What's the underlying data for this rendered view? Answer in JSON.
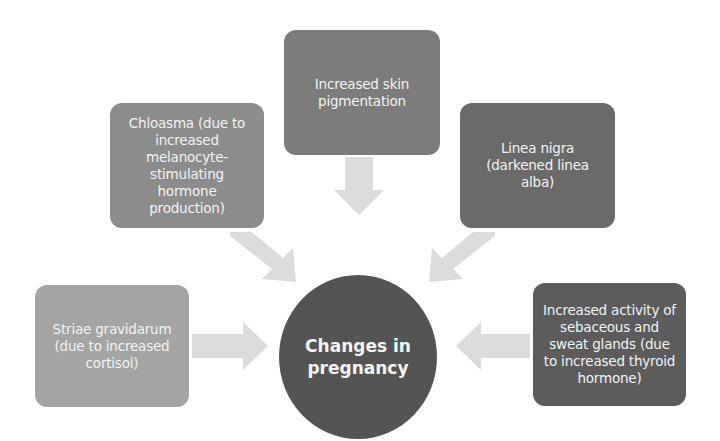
{
  "diagram": {
    "center": {
      "label": "Changes in pregnancy",
      "line1": "Changes in",
      "line2": "pregnancy",
      "color": "#545454"
    },
    "nodes": [
      {
        "id": "top",
        "label": "Increased skin pigmentation",
        "color": "#7c7c7c"
      },
      {
        "id": "upper-left",
        "label": "Chloasma (due to increased melanocyte-stimulating hormone production)",
        "color": "#8c8c8c"
      },
      {
        "id": "upper-right",
        "label": "Linea nigra (darkened linea alba)",
        "color": "#6a6a6a"
      },
      {
        "id": "left",
        "label": "Striae gravidarum (due to increased cortisol)",
        "color": "#a4a4a4"
      },
      {
        "id": "right",
        "label": "Increased activity of sebaceous and sweat glands (due to increased thyroid hormone)",
        "color": "#5c5c5c"
      }
    ],
    "arrow_color": "#dcdcdc"
  }
}
